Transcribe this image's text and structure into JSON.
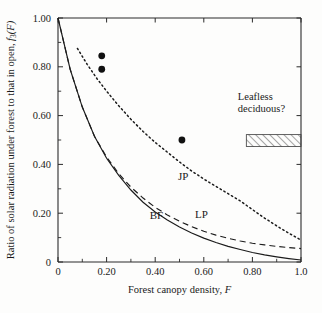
{
  "chart_data": {
    "type": "line",
    "title": "",
    "xlabel": "Forest canopy density, F",
    "ylabel": "Ratio of solar radiation under forest to that in open, f3(F)",
    "ylabel_parts": {
      "main": "Ratio of solar radiation under forest to that in open, ",
      "symbol": "f",
      "subscript": "3",
      "arg": "(F)"
    },
    "xlim": [
      0,
      1.0
    ],
    "ylim": [
      0,
      1.0
    ],
    "grid": false,
    "legend_position": "inline-labels",
    "xticks": [
      0,
      0.2,
      0.4,
      0.6,
      0.8,
      1.0
    ],
    "xtick_labels": [
      "0",
      "0.20",
      "0.40",
      "0.60",
      "0.80",
      "1.0"
    ],
    "xticks_minor": [
      0.1,
      0.3,
      0.5,
      0.7,
      0.9
    ],
    "yticks": [
      0,
      0.2,
      0.4,
      0.6,
      0.8,
      1.0
    ],
    "ytick_labels": [
      "0",
      "0.20",
      "0.40",
      "0.60",
      "0.80",
      "1.00"
    ],
    "yticks_minor": [
      0.1,
      0.3,
      0.5,
      0.7,
      0.9
    ],
    "series": [
      {
        "name": "BF",
        "label": "BF",
        "style": "solid",
        "label_x": 0.405,
        "label_y": 0.175,
        "x": [
          0.0,
          0.05,
          0.1,
          0.15,
          0.2,
          0.25,
          0.3,
          0.35,
          0.4,
          0.45,
          0.5,
          0.55,
          0.6,
          0.65,
          0.7,
          0.75,
          0.8,
          0.85,
          0.9,
          0.95,
          1.0
        ],
        "values": [
          1.0,
          0.79,
          0.635,
          0.515,
          0.425,
          0.355,
          0.295,
          0.245,
          0.205,
          0.172,
          0.143,
          0.119,
          0.098,
          0.08,
          0.064,
          0.051,
          0.039,
          0.029,
          0.021,
          0.014,
          0.008
        ]
      },
      {
        "name": "LP",
        "label": "LP",
        "style": "dashed",
        "label_x": 0.59,
        "label_y": 0.18,
        "x": [
          0.0,
          0.05,
          0.1,
          0.15,
          0.2,
          0.25,
          0.3,
          0.35,
          0.4,
          0.45,
          0.5,
          0.55,
          0.6,
          0.65,
          0.7,
          0.75,
          0.8,
          0.85,
          0.9,
          0.95,
          1.0
        ],
        "values": [
          1.0,
          0.79,
          0.635,
          0.515,
          0.43,
          0.362,
          0.307,
          0.262,
          0.224,
          0.193,
          0.167,
          0.145,
          0.126,
          0.11,
          0.097,
          0.086,
          0.077,
          0.07,
          0.064,
          0.059,
          0.055
        ]
      },
      {
        "name": "JP",
        "label": "JP",
        "style": "dotted",
        "label_x": 0.515,
        "label_y": 0.335,
        "x": [
          0.08,
          0.12,
          0.16,
          0.2,
          0.25,
          0.3,
          0.35,
          0.4,
          0.45,
          0.5,
          0.55,
          0.6,
          0.65,
          0.7,
          0.75,
          0.8,
          0.85,
          0.9,
          0.95,
          1.0
        ],
        "values": [
          0.875,
          0.81,
          0.752,
          0.7,
          0.64,
          0.585,
          0.535,
          0.49,
          0.45,
          0.41,
          0.373,
          0.34,
          0.31,
          0.28,
          0.25,
          0.215,
          0.18,
          0.148,
          0.118,
          0.09
        ]
      }
    ],
    "points": [
      {
        "x": 0.18,
        "y": 0.845
      },
      {
        "x": 0.18,
        "y": 0.79
      },
      {
        "x": 0.51,
        "y": 0.5
      }
    ],
    "annotations": [
      {
        "name": "leafless-deciduous",
        "lines": [
          "Leafless",
          "deciduous?"
        ],
        "text_x": 0.74,
        "text_y": 0.665,
        "band": {
          "x0": 0.775,
          "x1": 1.0,
          "y0": 0.473,
          "y1": 0.522,
          "fill": "hatched"
        }
      }
    ],
    "colors": {
      "axis": "#2b2b2b",
      "curve": "#1b1b1b",
      "point": "#111111",
      "background": "#fdfdfc"
    }
  }
}
